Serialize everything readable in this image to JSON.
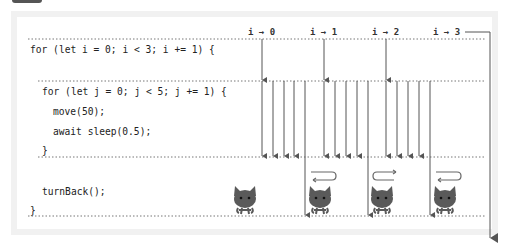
{
  "diagram": {
    "iteration_labels": [
      "i → 0",
      "i → 1",
      "i → 2",
      "i → 3"
    ],
    "code": {
      "outer_for": "for (let i = 0; i < 3; i += 1) {",
      "inner_for": "for (let j = 0; j < 5; j += 1) {",
      "move": "move(50);",
      "sleep": "await sleep(0.5);",
      "inner_close": "}",
      "turn": "turnBack();",
      "outer_close": "}"
    },
    "inner_steps_per_iteration": 5,
    "outer_iterations": 3,
    "cats": [
      {
        "position": "initial",
        "turn_arrow": "none"
      },
      {
        "position": "after-i0",
        "turn_arrow": "left"
      },
      {
        "position": "after-i1",
        "turn_arrow": "right"
      },
      {
        "position": "after-i2",
        "turn_arrow": "left"
      }
    ],
    "colors": {
      "line": "#555555",
      "dots": "#777777",
      "frame": "#f1f1f1",
      "cat": "#5a5a5a"
    }
  }
}
